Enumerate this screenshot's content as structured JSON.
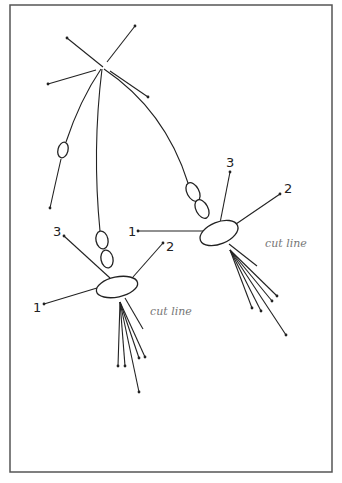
{
  "figure": {
    "frame": {
      "x": 10,
      "y": 5,
      "w": 322,
      "h": 467,
      "color": "#555555"
    },
    "top_pole": {
      "center": [
        102,
        68
      ],
      "rays": [
        {
          "from": [
            67,
            38
          ],
          "to": [
            103,
            67
          ]
        },
        {
          "from": [
            135,
            26
          ],
          "to": [
            107,
            62
          ]
        },
        {
          "from": [
            48,
            84
          ],
          "to": [
            96,
            70
          ]
        },
        {
          "from": [
            110,
            71
          ],
          "to": [
            148,
            97
          ]
        }
      ]
    },
    "left_branch": {
      "label": "single chromatid",
      "ellipse": {
        "cx": 63,
        "cy": 150,
        "rx": 5,
        "ry": 8,
        "rotate": 15
      },
      "end": [
        50,
        208
      ]
    },
    "spindle_left": {
      "labels": {
        "one": "1",
        "two": "2",
        "three": "3"
      },
      "cut_label": "cut line",
      "ellipse": {
        "cx": 117,
        "cy": 287,
        "rx": 21,
        "ry": 10,
        "rotate": -12
      }
    },
    "spindle_right": {
      "labels": {
        "one": "1",
        "two": "2",
        "three": "3"
      },
      "cut_label": "cut line",
      "ellipse": {
        "cx": 219,
        "cy": 233,
        "rx": 20,
        "ry": 11,
        "rotate": -22
      }
    }
  }
}
